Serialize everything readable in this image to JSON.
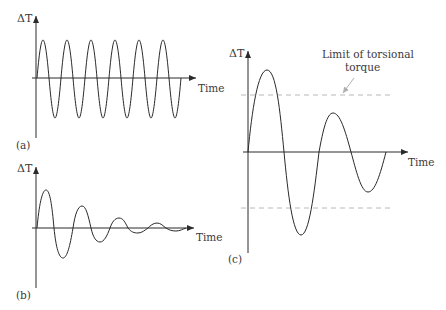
{
  "figure": {
    "panels": [
      {
        "id": "a",
        "tag": "(a)",
        "y_label": "ΔT",
        "x_label": "Time",
        "description": "Sustained (undamped) torque oscillation",
        "cycles": 6,
        "amplitude_px": 39
      },
      {
        "id": "b",
        "tag": "(b)",
        "y_label": "ΔT",
        "x_label": "Time",
        "description": "Damped torque oscillation decaying with time",
        "cycles": 5
      },
      {
        "id": "c",
        "tag": "(c)",
        "y_label": "ΔT",
        "x_label": "Time",
        "description": "Oscillation exceeding limit of torsional torque",
        "annotation": {
          "line1": "Limit of torsional",
          "line2": "torque"
        },
        "limit_lines": [
          "upper",
          "lower"
        ]
      }
    ],
    "colors": {
      "ink": "#2a2a2a",
      "limit_line": "#b8b8b8",
      "text": "#3a3a3a"
    }
  }
}
